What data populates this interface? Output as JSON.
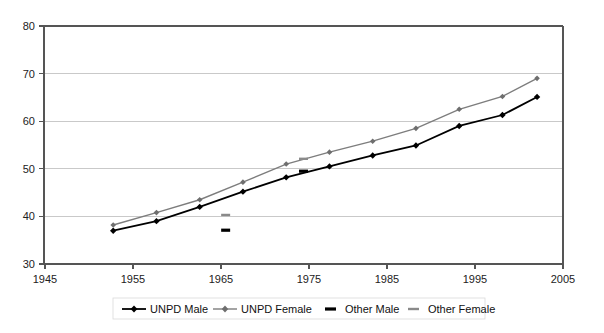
{
  "chart_data": {
    "type": "line",
    "title": "",
    "subtitle": "",
    "xlabel": "",
    "ylabel": "",
    "xlim": [
      1945,
      2005
    ],
    "ylim": [
      30,
      80
    ],
    "xticks": [
      1945,
      1955,
      1965,
      1975,
      1985,
      1995,
      2005
    ],
    "yticks": [
      30,
      40,
      50,
      60,
      70,
      80
    ],
    "grid": "horizontal",
    "legend_position": "bottom",
    "series": [
      {
        "name": "UNPD Male",
        "style": "line+diamond",
        "color": "#000000",
        "x": [
          1953,
          1958,
          1963,
          1968,
          1973,
          1978,
          1983,
          1988,
          1993,
          1998,
          2002
        ],
        "values": [
          37.0,
          39.0,
          42.0,
          45.2,
          48.2,
          50.5,
          52.8,
          54.9,
          59.0,
          61.3,
          65.1
        ]
      },
      {
        "name": "UNPD Female",
        "style": "line+diamond",
        "color": "#6e6e6e",
        "x": [
          1953,
          1958,
          1963,
          1968,
          1973,
          1978,
          1983,
          1988,
          1993,
          1998,
          2002
        ],
        "values": [
          38.2,
          40.8,
          43.5,
          47.2,
          51.0,
          53.5,
          55.8,
          58.5,
          62.5,
          65.2,
          69.0
        ]
      },
      {
        "name": "Other Male",
        "style": "dash-marker",
        "color": "#000000",
        "x": [
          1966,
          1975
        ],
        "values": [
          37.1,
          49.5
        ]
      },
      {
        "name": "Other Female",
        "style": "dash-marker",
        "color": "#8a8a8a",
        "x": [
          1966,
          1975
        ],
        "values": [
          40.3,
          52.1
        ]
      }
    ]
  },
  "axes": {
    "y_tick_labels": [
      "30",
      "40",
      "50",
      "60",
      "70",
      "80"
    ],
    "x_tick_labels": [
      "1945",
      "1955",
      "1965",
      "1975",
      "1985",
      "1995",
      "2005"
    ]
  },
  "legend": {
    "items": [
      {
        "label": "UNPD Male",
        "marker": "line-diamond-black"
      },
      {
        "label": "UNPD Female",
        "marker": "line-diamond-gray"
      },
      {
        "label": "Other Male",
        "marker": "dash-black"
      },
      {
        "label": "Other Female",
        "marker": "dash-gray"
      }
    ]
  }
}
